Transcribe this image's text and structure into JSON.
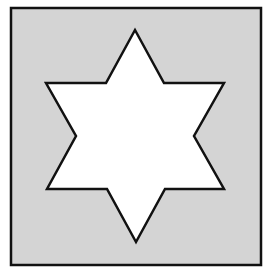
{
  "figure": {
    "colors": {
      "page_background": "#ffffff",
      "square_fill": "#d4d4d4",
      "square_stroke": "#111111",
      "star_fill": "#ffffff",
      "star_stroke": "#111111"
    },
    "square": {
      "x": 11,
      "y": 8,
      "width": 250,
      "height": 257,
      "stroke_width": 2.5
    },
    "star": {
      "shape": "hexagram",
      "stroke_width": 2.5,
      "points": [
        [
          135,
          30
        ],
        [
          164,
          83
        ],
        [
          224,
          83
        ],
        [
          194,
          136
        ],
        [
          224,
          189
        ],
        [
          165,
          189
        ],
        [
          136,
          242
        ],
        [
          107,
          189
        ],
        [
          47,
          189
        ],
        [
          76,
          136
        ],
        [
          46,
          83
        ],
        [
          106,
          83
        ]
      ]
    }
  }
}
